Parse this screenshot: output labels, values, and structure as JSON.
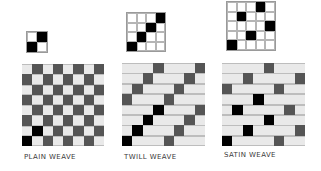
{
  "weaves": [
    {
      "label": "PLAIN WEAVE",
      "small": {
        "n": 2,
        "x": 26,
        "y": 31,
        "size": 20,
        "on": [
          [
            0,
            1
          ],
          [
            1,
            0
          ]
        ]
      },
      "big": {
        "x": 22,
        "y": 64,
        "size": 82,
        "n": 8,
        "pattern": [
          "WBWBWBWB",
          "BWBWBWBW",
          "WBWBWBWB",
          "BWBWBWBW",
          "WBWBWBWB",
          "BWBWBWBW",
          "WBWBWBWB",
          "BWBWBWBW"
        ],
        "highlight": [
          [
            7,
            0
          ],
          [
            6,
            1
          ]
        ]
      },
      "label_pos": {
        "x": 24,
        "y": 153
      }
    },
    {
      "label": "TWILL WEAVE",
      "small": {
        "n": 4,
        "x": 126,
        "y": 12,
        "size": 38,
        "on": [
          [
            0,
            3
          ],
          [
            1,
            2
          ],
          [
            2,
            1
          ],
          [
            3,
            0
          ]
        ]
      },
      "big": {
        "x": 122,
        "y": 63,
        "size": 83,
        "n": 8,
        "pattern": [
          "WWWBWWWB",
          "WWBWWWBW",
          "WBWWWBWW",
          "BWWWBWWW",
          "WWWBWWWB",
          "WWBWWWBW",
          "WBWWWBWW",
          "BWWWBWWW"
        ],
        "highlight": [
          [
            7,
            0
          ],
          [
            6,
            1
          ],
          [
            5,
            2
          ],
          [
            4,
            3
          ]
        ]
      },
      "label_pos": {
        "x": 124,
        "y": 153
      }
    },
    {
      "label": "SATIN WEAVE",
      "small": {
        "n": 5,
        "x": 226,
        "y": 1,
        "size": 48,
        "on": [
          [
            0,
            3
          ],
          [
            1,
            1
          ],
          [
            2,
            4
          ],
          [
            3,
            2
          ],
          [
            4,
            0
          ]
        ]
      },
      "big": {
        "x": 222,
        "y": 63,
        "size": 83,
        "n": 8,
        "pattern": [
          "WWWWBWWW",
          "WWBWWWWB",
          "BWWWWBWW",
          "WWWBWWWW",
          "WBWWWWBW",
          "WWWWBWWW",
          "WWBWWWWB",
          "BWWWWBWW"
        ],
        "highlight": [
          [
            7,
            0
          ],
          [
            6,
            2
          ],
          [
            5,
            4
          ],
          [
            4,
            1
          ],
          [
            3,
            3
          ]
        ]
      },
      "label_pos": {
        "x": 224,
        "y": 151
      }
    }
  ],
  "colors": {
    "warp": "#555555",
    "weft": "#e9e9e9",
    "highlight": "#000000",
    "label": "#3a3a3a"
  }
}
